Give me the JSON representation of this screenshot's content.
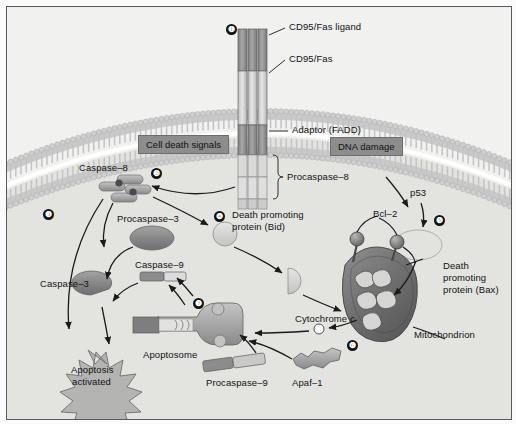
{
  "figure": {
    "background_color": "#e9e9e7",
    "border_color": "#5a5a5a"
  },
  "badges": [
    {
      "id": "step-1",
      "numeral": "❶",
      "x": 219,
      "y": 17
    },
    {
      "id": "step-2",
      "numeral": "❷",
      "x": 144,
      "y": 161
    },
    {
      "id": "step-3",
      "numeral": "❸",
      "x": 36,
      "y": 202
    },
    {
      "id": "step-4",
      "numeral": "❹",
      "x": 207,
      "y": 204
    },
    {
      "id": "step-5",
      "numeral": "❺",
      "x": 427,
      "y": 208
    },
    {
      "id": "step-6",
      "numeral": "❻",
      "x": 340,
      "y": 333
    },
    {
      "id": "step-7",
      "numeral": "❼",
      "x": 186,
      "y": 291
    }
  ],
  "labels": {
    "cd95_fas_ligand": "CD95/Fas ligand",
    "cd95_fas": "CD95/Fas",
    "adaptor_fadd": "Adaptor (FADD)",
    "procaspase_8": "Procaspase–8",
    "caspase_8": "Caspase–8",
    "procaspase_3": "Procaspase–3",
    "caspase_3": "Caspase–3",
    "caspase_9": "Caspase–9",
    "procaspase_9": "Procaspase–9",
    "apaf_1": "Apaf–1",
    "apoptosome": "Apoptosome",
    "apoptosis_activated_line1": "Apoptosis",
    "apoptosis_activated_line2": "activated",
    "bid_line1": "Death promoting",
    "bid_line2": "protein (Bid)",
    "bax_line1": "Death",
    "bax_line2": "promoting",
    "bax_line3": "protein (Bax)",
    "bcl_2": "Bcl–2",
    "p53": "p53",
    "cytochrome_c": "Cytochrome c",
    "mitochondrion": "Mitochondrion"
  },
  "boxed_labels": {
    "cell_death_signals": "Cell death signals",
    "dna_damage": "DNA damage"
  },
  "colors": {
    "cell_interior": "#e4e4e1",
    "extracellular": "#f2f2f0",
    "membrane": "#b9b9b9",
    "receptor_dark": "#8f8f8f",
    "receptor_light": "#d3d3d3",
    "protein_gray": "#9a9a9a",
    "protein_dark": "#7d7d7d",
    "protein_light": "#cfcfcf",
    "mitochondrion": "#6f6f6f",
    "badge": "#111111",
    "box_fill": "#8d8d8d",
    "arrow": "#1a1a1a"
  },
  "chart_data": {
    "type": "diagram",
    "nodes": [
      "CD95/Fas ligand",
      "CD95/Fas",
      "Adaptor (FADD)",
      "Procaspase-8",
      "Caspase-8",
      "Procaspase-3",
      "Caspase-3",
      "Death promoting protein (Bid)",
      "Mitochondrion",
      "Bcl-2",
      "p53",
      "Death promoting protein (Bax)",
      "Cytochrome c",
      "Apaf-1",
      "Procaspase-9",
      "Apoptosome",
      "Caspase-9",
      "Apoptosis activated"
    ],
    "edges": [
      {
        "from": "Procaspase-8",
        "to": "Caspase-8"
      },
      {
        "from": "Caspase-8",
        "to": "Caspase-3"
      },
      {
        "from": "Caspase-8",
        "to": "Apoptosis activated"
      },
      {
        "from": "Caspase-8",
        "to": "Death promoting protein (Bid)"
      },
      {
        "from": "Procaspase-3",
        "to": "Caspase-3"
      },
      {
        "from": "Caspase-3",
        "to": "Apoptosis activated"
      },
      {
        "from": "Death promoting protein (Bid)",
        "to": "Mitochondrion"
      },
      {
        "from": "DNA damage",
        "to": "p53"
      },
      {
        "from": "p53",
        "to": "Death promoting protein (Bax)"
      },
      {
        "from": "Death promoting protein (Bax)",
        "to": "Mitochondrion"
      },
      {
        "from": "Bcl-2",
        "to": "Mitochondrion"
      },
      {
        "from": "Mitochondrion",
        "to": "Cytochrome c"
      },
      {
        "from": "Cytochrome c",
        "to": "Apoptosome"
      },
      {
        "from": "Apaf-1",
        "to": "Apoptosome"
      },
      {
        "from": "Procaspase-9",
        "to": "Apoptosome"
      },
      {
        "from": "Apoptosome",
        "to": "Caspase-9"
      },
      {
        "from": "Caspase-9",
        "to": "Caspase-3"
      }
    ]
  }
}
